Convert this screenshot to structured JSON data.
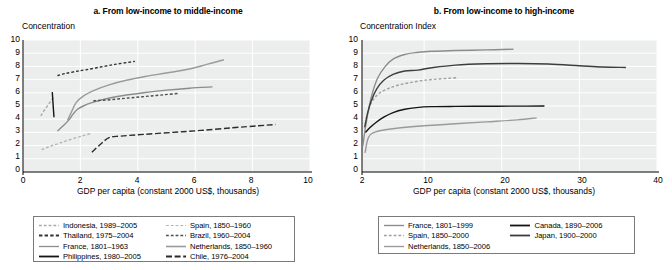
{
  "figure": {
    "panels": [
      {
        "id": "panel-a",
        "title": "a. From low-income to middle-income",
        "ylabel": "Concentration",
        "xlabel": "GDP per capita (constant 2000 US$, thousands)",
        "yticks": [
          "10",
          "9",
          "8",
          "7",
          "6",
          "5",
          "4",
          "3",
          "2",
          "1",
          "0"
        ],
        "xticks": [
          "0",
          "2",
          "4",
          "6",
          "8",
          "10"
        ]
      },
      {
        "id": "panel-b",
        "title": "b. From low-income to high-income",
        "ylabel": "Concentration Index",
        "xlabel": "GDP per capita (constant 2000 US$, thousands)",
        "yticks": [
          "10",
          "9",
          "8",
          "7",
          "6",
          "5",
          "4",
          "3",
          "2",
          "1",
          "0"
        ],
        "xticks": [
          "2",
          "10",
          "20",
          "30",
          "40"
        ]
      }
    ],
    "legends": [
      {
        "id": "legend-a",
        "columns": [
          [
            {
              "label": "Indonesia, 1989–2005",
              "style": "dashed",
              "color": "#a8a8a8",
              "width": 1.3
            },
            {
              "label": "Thailand, 1975–2004",
              "style": "dashed",
              "color": "#333333",
              "width": 1.8
            },
            {
              "label": "France, 1801–1963",
              "style": "solid",
              "color": "#8c8c8c",
              "width": 1.3
            },
            {
              "label": "Philippines, 1980–2005",
              "style": "solid",
              "color": "#141414",
              "width": 1.8
            }
          ],
          [
            {
              "label": "Spain, 1850–1960",
              "style": "dashed",
              "color": "#b4b4b4",
              "width": 1.2
            },
            {
              "label": "Brazil, 1960–2004",
              "style": "dashed",
              "color": "#4d4d4d",
              "width": 1.3
            },
            {
              "label": "Netherlands, 1850–1960",
              "style": "solid",
              "color": "#9a9a9a",
              "width": 1.6
            },
            {
              "label": "Chile, 1976–2004",
              "style": "longdash",
              "color": "#2b2b2b",
              "width": 1.8
            }
          ]
        ]
      },
      {
        "id": "legend-b",
        "columns": [
          [
            {
              "label": "France, 1801–1999",
              "style": "solid",
              "color": "#8c8c8c",
              "width": 1.4
            },
            {
              "label": "Spain, 1850–2000",
              "style": "dashed",
              "color": "#a0a0a0",
              "width": 1.3
            },
            {
              "label": "Netherlands, 1850–2006",
              "style": "solid",
              "color": "#9a9a9a",
              "width": 1.4
            }
          ],
          [
            {
              "label": "Canada, 1890–2006",
              "style": "solid",
              "color": "#141414",
              "width": 1.8
            },
            {
              "label": "Japan, 1900–2000",
              "style": "solid",
              "color": "#3d3d3d",
              "width": 1.8
            }
          ]
        ]
      }
    ]
  },
  "chart_data": [
    {
      "type": "line",
      "title": "a. From low-income to middle-income",
      "xlabel": "GDP per capita (constant 2000 US$, thousands)",
      "ylabel": "Concentration",
      "xlim": [
        0,
        10
      ],
      "ylim": [
        0,
        10
      ],
      "grid": true,
      "legend_position": "below",
      "series": [
        {
          "name": "Indonesia, 1989–2005",
          "style": "dashed",
          "color": "#a8a8a8",
          "points": [
            [
              0.62,
              4.25
            ],
            [
              0.75,
              4.7
            ],
            [
              0.88,
              5.1
            ],
            [
              1.0,
              5.45
            ],
            [
              1.08,
              5.7
            ]
          ]
        },
        {
          "name": "Thailand, 1975–2004",
          "style": "dashed",
          "color": "#333333",
          "points": [
            [
              1.2,
              7.3
            ],
            [
              1.45,
              7.45
            ],
            [
              1.8,
              7.6
            ],
            [
              2.2,
              7.75
            ],
            [
              2.7,
              7.95
            ],
            [
              3.2,
              8.15
            ],
            [
              3.65,
              8.3
            ],
            [
              3.9,
              8.38
            ]
          ]
        },
        {
          "name": "France, 1801–1963",
          "style": "solid",
          "color": "#8c8c8c",
          "points": [
            [
              1.2,
              3.1
            ],
            [
              1.4,
              3.5
            ],
            [
              1.6,
              3.95
            ],
            [
              1.75,
              4.4
            ],
            [
              1.9,
              4.75
            ],
            [
              2.1,
              5.0
            ],
            [
              2.4,
              5.25
            ],
            [
              2.9,
              5.55
            ],
            [
              3.5,
              5.8
            ],
            [
              4.2,
              6.0
            ],
            [
              5.0,
              6.2
            ],
            [
              5.8,
              6.35
            ],
            [
              6.6,
              6.45
            ]
          ]
        },
        {
          "name": "Philippines, 1980–2005",
          "style": "solid",
          "color": "#141414",
          "points": [
            [
              1.02,
              6.05
            ],
            [
              1.04,
              5.4
            ],
            [
              1.06,
              4.75
            ],
            [
              1.08,
              4.15
            ]
          ]
        },
        {
          "name": "Spain, 1850–1960",
          "style": "dashed",
          "color": "#b4b4b4",
          "points": [
            [
              0.65,
              1.7
            ],
            [
              0.95,
              1.95
            ],
            [
              1.3,
              2.2
            ],
            [
              1.7,
              2.5
            ],
            [
              2.1,
              2.75
            ],
            [
              2.4,
              2.95
            ]
          ]
        },
        {
          "name": "Brazil, 1960–2004",
          "style": "dashed",
          "color": "#4d4d4d",
          "points": [
            [
              2.45,
              5.4
            ],
            [
              2.9,
              5.45
            ],
            [
              3.4,
              5.55
            ],
            [
              3.9,
              5.65
            ],
            [
              4.4,
              5.75
            ],
            [
              4.9,
              5.85
            ],
            [
              5.4,
              5.95
            ]
          ]
        },
        {
          "name": "Netherlands, 1850–1960",
          "style": "solid",
          "color": "#9a9a9a",
          "points": [
            [
              1.55,
              3.9
            ],
            [
              1.7,
              4.6
            ],
            [
              1.85,
              5.25
            ],
            [
              2.1,
              5.75
            ],
            [
              2.5,
              6.2
            ],
            [
              3.0,
              6.6
            ],
            [
              3.6,
              6.95
            ],
            [
              4.3,
              7.25
            ],
            [
              5.0,
              7.5
            ],
            [
              5.8,
              7.8
            ],
            [
              6.4,
              8.15
            ],
            [
              7.0,
              8.5
            ]
          ]
        },
        {
          "name": "Chile, 1976–2004",
          "style": "longdash",
          "color": "#2b2b2b",
          "points": [
            [
              2.4,
              1.5
            ],
            [
              2.7,
              2.1
            ],
            [
              3.0,
              2.6
            ],
            [
              3.4,
              2.72
            ],
            [
              4.2,
              2.85
            ],
            [
              5.2,
              3.0
            ],
            [
              6.2,
              3.15
            ],
            [
              7.3,
              3.35
            ],
            [
              8.2,
              3.5
            ],
            [
              8.8,
              3.6
            ]
          ]
        }
      ]
    },
    {
      "type": "line",
      "title": "b. From low-income to high-income",
      "xlabel": "GDP per capita (constant 2000 US$, thousands)",
      "ylabel": "Concentration Index",
      "xlim": [
        2,
        40
      ],
      "ylim": [
        0,
        10
      ],
      "grid": true,
      "legend_position": "below",
      "series": [
        {
          "name": "France, 1801–1999",
          "style": "solid",
          "color": "#8c8c8c",
          "points": [
            [
              2.1,
              1.95
            ],
            [
              2.4,
              3.2
            ],
            [
              2.8,
              4.6
            ],
            [
              3.3,
              5.9
            ],
            [
              4.0,
              7.1
            ],
            [
              5.0,
              8.0
            ],
            [
              6.0,
              8.55
            ],
            [
              7.5,
              8.9
            ],
            [
              9.0,
              9.05
            ],
            [
              11.0,
              9.15
            ],
            [
              14.0,
              9.2
            ],
            [
              18.0,
              9.25
            ],
            [
              21.5,
              9.3
            ]
          ]
        },
        {
          "name": "Spain, 1850–2000",
          "style": "dashed",
          "color": "#a0a0a0",
          "points": [
            [
              2.35,
              3.3
            ],
            [
              2.6,
              4.2
            ],
            [
              3.0,
              5.0
            ],
            [
              3.6,
              5.6
            ],
            [
              4.3,
              6.0
            ],
            [
              5.3,
              6.3
            ],
            [
              6.5,
              6.55
            ],
            [
              8.0,
              6.75
            ],
            [
              10.0,
              6.95
            ],
            [
              12.0,
              7.05
            ],
            [
              14.3,
              7.15
            ]
          ]
        },
        {
          "name": "Netherlands, 1850–2006",
          "style": "solid",
          "color": "#9a9a9a",
          "points": [
            [
              2.4,
              1.45
            ],
            [
              2.7,
              2.4
            ],
            [
              3.1,
              2.85
            ],
            [
              3.8,
              3.05
            ],
            [
              5.0,
              3.2
            ],
            [
              7.0,
              3.35
            ],
            [
              10.0,
              3.5
            ],
            [
              14.0,
              3.65
            ],
            [
              18.0,
              3.8
            ],
            [
              22.0,
              3.95
            ],
            [
              24.5,
              4.1
            ]
          ]
        },
        {
          "name": "Canada, 1890–2006",
          "style": "solid",
          "color": "#141414",
          "points": [
            [
              2.45,
              3.0
            ],
            [
              3.0,
              3.35
            ],
            [
              3.8,
              3.75
            ],
            [
              4.8,
              4.15
            ],
            [
              6.0,
              4.5
            ],
            [
              7.5,
              4.75
            ],
            [
              9.0,
              4.88
            ],
            [
              11.0,
              4.95
            ],
            [
              14.0,
              4.97
            ],
            [
              18.0,
              4.98
            ],
            [
              22.0,
              4.99
            ],
            [
              25.5,
              5.0
            ]
          ]
        },
        {
          "name": "Japan, 1900–2000",
          "style": "solid",
          "color": "#3d3d3d",
          "points": [
            [
              2.35,
              3.4
            ],
            [
              2.7,
              4.4
            ],
            [
              3.2,
              5.4
            ],
            [
              3.9,
              6.3
            ],
            [
              4.8,
              6.95
            ],
            [
              6.0,
              7.4
            ],
            [
              7.5,
              7.65
            ],
            [
              9.2,
              7.72
            ],
            [
              11.0,
              7.9
            ],
            [
              14.0,
              8.1
            ],
            [
              18.0,
              8.2
            ],
            [
              22.0,
              8.22
            ],
            [
              26.0,
              8.18
            ],
            [
              30.0,
              8.05
            ],
            [
              33.0,
              7.95
            ],
            [
              36.0,
              7.92
            ]
          ]
        }
      ]
    }
  ]
}
